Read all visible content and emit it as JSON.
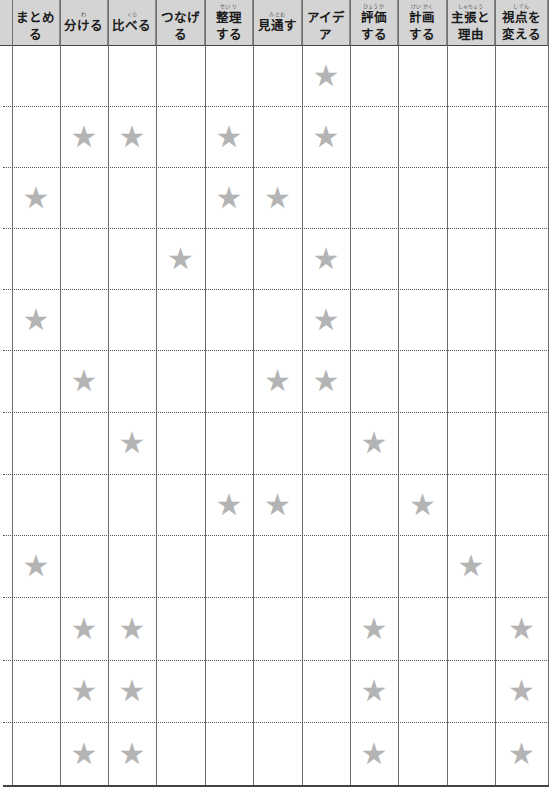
{
  "header": {
    "columns": [
      {
        "label": "まとめる",
        "line2": "",
        "ruby": ""
      },
      {
        "label": "分ける",
        "line2": "",
        "ruby": "わ"
      },
      {
        "label": "比べる",
        "line2": "",
        "ruby": "くら"
      },
      {
        "label": "つなげる",
        "line2": "",
        "ruby": ""
      },
      {
        "label": "整理",
        "line2": "する",
        "ruby": "せい り"
      },
      {
        "label": "見通す",
        "line2": "",
        "ruby": "み とお"
      },
      {
        "label": "アイデア",
        "line2": "",
        "ruby": ""
      },
      {
        "label": "評価",
        "line2": "する",
        "ruby": "ひょう か"
      },
      {
        "label": "計画",
        "line2": "する",
        "ruby": "けい かく"
      },
      {
        "label": "主張と",
        "line2": "理由",
        "ruby": "しゅちょう"
      },
      {
        "label": "視点を",
        "line2": "変える",
        "ruby": "し てん"
      }
    ]
  },
  "star_glyph": "★",
  "colors": {
    "header_bg": "#d4d4d4",
    "star": "#b4b4b4",
    "grid": "#6e6e6e"
  },
  "rows": [
    [
      0,
      0,
      0,
      0,
      0,
      0,
      1,
      0,
      0,
      0,
      0
    ],
    [
      0,
      1,
      1,
      0,
      1,
      0,
      1,
      0,
      0,
      0,
      0
    ],
    [
      1,
      0,
      0,
      0,
      1,
      1,
      0,
      0,
      0,
      0,
      0
    ],
    [
      0,
      0,
      0,
      1,
      0,
      0,
      1,
      0,
      0,
      0,
      0
    ],
    [
      1,
      0,
      0,
      0,
      0,
      0,
      1,
      0,
      0,
      0,
      0
    ],
    [
      0,
      1,
      0,
      0,
      0,
      1,
      1,
      0,
      0,
      0,
      0
    ],
    [
      0,
      0,
      1,
      0,
      0,
      0,
      0,
      1,
      0,
      0,
      0
    ],
    [
      0,
      0,
      0,
      0,
      1,
      1,
      0,
      0,
      1,
      0,
      0
    ],
    [
      1,
      0,
      0,
      0,
      0,
      0,
      0,
      0,
      0,
      1,
      0
    ],
    [
      0,
      1,
      1,
      0,
      0,
      0,
      0,
      1,
      0,
      0,
      1
    ],
    [
      0,
      1,
      1,
      0,
      0,
      0,
      0,
      1,
      0,
      0,
      1
    ],
    [
      0,
      1,
      1,
      0,
      0,
      0,
      0,
      1,
      0,
      0,
      1
    ]
  ]
}
